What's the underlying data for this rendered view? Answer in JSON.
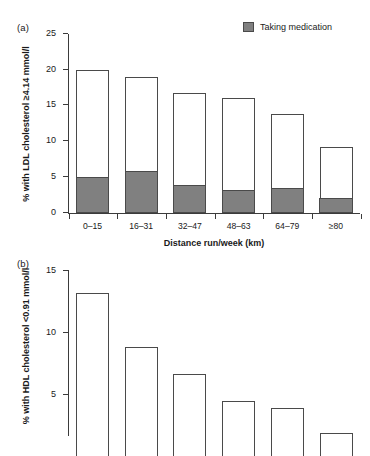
{
  "figure": {
    "panels": [
      {
        "tag": "(a)",
        "type": "stacked-bar"
      },
      {
        "tag": "(b)",
        "type": "bar"
      }
    ]
  },
  "legend": {
    "label": "Taking medication",
    "swatch_color": "#808080"
  },
  "chart_data": [
    {
      "type": "bar",
      "panel": "(a)",
      "title": "",
      "stacked": true,
      "categories": [
        "0–15",
        "16–31",
        "32–47",
        "48–63",
        "64–79",
        "≥80"
      ],
      "series": [
        {
          "name": "Taking medication",
          "values": [
            4.9,
            5.7,
            3.8,
            3.1,
            3.3,
            1.9
          ],
          "color": "#808080"
        },
        {
          "name": "Not taking medication",
          "values": [
            15.1,
            13.3,
            12.9,
            12.9,
            10.5,
            7.3
          ],
          "color": "#ffffff"
        }
      ],
      "totals": [
        20.0,
        19.0,
        16.7,
        16.0,
        13.8,
        9.2
      ],
      "xlabel": "Distance run/week (km)",
      "ylabel": "% with LDL cholesterol ≥4.14 mmol/l",
      "ylim": [
        0,
        25
      ],
      "yticks": [
        "0",
        "5",
        "10",
        "15",
        "20",
        "25"
      ],
      "ytick_values": [
        0,
        5,
        10,
        15,
        20,
        25
      ],
      "grid": false,
      "legend_position": "top-right"
    },
    {
      "type": "bar",
      "panel": "(b)",
      "title": "",
      "stacked": false,
      "categories": [
        "0–15",
        "16–31",
        "32–47",
        "48–63",
        "64–79",
        "≥80"
      ],
      "values": [
        13.1,
        8.8,
        6.6,
        4.4,
        3.8,
        1.8
      ],
      "xlabel": "",
      "ylabel": "% with HDL cholesterol <0.91 mmol/l",
      "ylim": [
        0,
        15
      ],
      "yticks": [
        "5",
        "10",
        "15"
      ],
      "ytick_values": [
        5,
        10,
        15
      ],
      "grid": false,
      "legend_position": "none",
      "note": "panel cropped at image bottom edge"
    }
  ]
}
